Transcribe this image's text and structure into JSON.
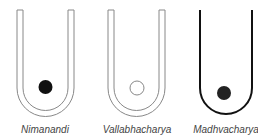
{
  "figures": [
    {
      "label": "Nimanandi",
      "tube": "double-line",
      "ball": "filled"
    },
    {
      "label": "Vallabhacharya",
      "tube": "double-line",
      "ball": "hollow"
    },
    {
      "label": "Madhvacharya",
      "tube": "single-thick-line",
      "ball": "filled"
    }
  ],
  "colors": {
    "line": "#888888",
    "dark_line": "#111111",
    "ball": "#111111"
  }
}
